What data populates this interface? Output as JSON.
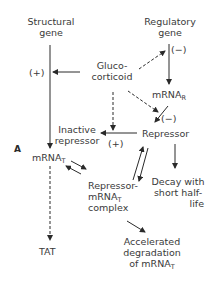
{
  "panel_label": "A",
  "nodes": {
    "structural_gene": {
      "line1": "Structural",
      "line2": "gene"
    },
    "regulatory_gene": {
      "line1": "Regulatory",
      "line2": "gene"
    },
    "glucocorticoid": {
      "line1": "Gluco-",
      "line2": "corticoid"
    },
    "mrna_r": {
      "base": "mRNA",
      "sub": "R"
    },
    "inactive_repressor": {
      "line1": "Inactive",
      "line2": "repressor"
    },
    "repressor": {
      "text": "Repressor"
    },
    "mrna_t": {
      "base": "mRNA",
      "sub": "T"
    },
    "decay": {
      "line1": "Decay with",
      "line2": "short half-",
      "line3": "life"
    },
    "complex": {
      "line1": "Repressor-",
      "line2_base": "mRNA",
      "line2_sub": "T",
      "line3": "complex"
    },
    "tat": {
      "text": "TAT"
    },
    "accelerated": {
      "line1": "Accelerated",
      "line2": "degradation",
      "line3_base": "of mRNA",
      "line3_sub": "T"
    }
  },
  "signs": {
    "structural_plus": "(+)",
    "regulatory_minus": "(−)",
    "repressor_minus": "(−)",
    "inactive_plus": "(+)"
  },
  "edges": [
    {
      "from": "structural_gene",
      "to": "mrna_t",
      "style": "solid"
    },
    {
      "from": "glucocorticoid",
      "to": "structural_gene",
      "style": "solid",
      "effect": "+"
    },
    {
      "from": "glucocorticoid",
      "to": "regulatory_gene",
      "style": "dashed",
      "effect": "−"
    },
    {
      "from": "regulatory_gene",
      "to": "mrna_r",
      "style": "solid"
    },
    {
      "from": "mrna_r",
      "to": "repressor",
      "style": "solid"
    },
    {
      "from": "glucocorticoid",
      "to": "repressor",
      "style": "dashed",
      "effect": "−"
    },
    {
      "from": "glucocorticoid",
      "to": "inactive_repressor",
      "style": "dashed"
    },
    {
      "from": "repressor",
      "to": "inactive_repressor",
      "style": "solid",
      "effect": "+"
    },
    {
      "from": "repressor",
      "to": "decay",
      "style": "solid"
    },
    {
      "from": "repressor",
      "to": "complex",
      "style": "solid",
      "bidirectional": true
    },
    {
      "from": "mrna_t",
      "to": "complex",
      "style": "solid",
      "bidirectional": true
    },
    {
      "from": "complex",
      "to": "accelerated",
      "style": "solid"
    },
    {
      "from": "mrna_t",
      "to": "tat",
      "style": "dashed"
    }
  ]
}
